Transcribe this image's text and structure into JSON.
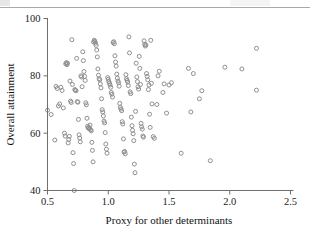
{
  "figure": {
    "header_rule": "page-header-rule",
    "background": "#ffffff",
    "point_color": "#8f8f8f",
    "axis_color": "#6f6f6f"
  },
  "chart_data": {
    "type": "scatter",
    "title": "",
    "xlabel": "Proxy for other determinants",
    "ylabel": "Overall attainment",
    "xlim": [
      0.5,
      2.5
    ],
    "ylim": [
      40,
      100
    ],
    "xticks": [
      0.5,
      1.0,
      1.5,
      2.0,
      2.5
    ],
    "xticklabels": [
      "0.5",
      "1.0",
      "1.5",
      "2.0",
      "2.5"
    ],
    "yticks": [
      40,
      60,
      80,
      100
    ],
    "yticklabels": [
      "40",
      "60",
      "80",
      "100"
    ],
    "grid": false,
    "legend": null,
    "marker": "open-circle",
    "marker_size": 4,
    "n_points": 171,
    "points": [
      [
        0.5,
        68.0
      ],
      [
        0.53,
        66.5
      ],
      [
        0.56,
        57.6
      ],
      [
        0.57,
        76.3
      ],
      [
        0.58,
        75.6
      ],
      [
        0.59,
        69.5
      ],
      [
        0.6,
        70.2
      ],
      [
        0.61,
        76.0
      ],
      [
        0.62,
        74.9
      ],
      [
        0.63,
        68.8
      ],
      [
        0.64,
        60.0
      ],
      [
        0.645,
        59.0
      ],
      [
        0.65,
        84.2
      ],
      [
        0.655,
        84.6
      ],
      [
        0.66,
        83.9
      ],
      [
        0.665,
        84.4
      ],
      [
        0.67,
        56.6
      ],
      [
        0.675,
        57.8
      ],
      [
        0.68,
        58.9
      ],
      [
        0.685,
        78.2
      ],
      [
        0.69,
        71.2
      ],
      [
        0.695,
        70.7
      ],
      [
        0.7,
        92.6
      ],
      [
        0.705,
        77.0
      ],
      [
        0.71,
        53.2
      ],
      [
        0.715,
        49.4
      ],
      [
        0.72,
        40.0
      ],
      [
        0.725,
        75.2
      ],
      [
        0.73,
        75.0
      ],
      [
        0.735,
        74.8
      ],
      [
        0.74,
        86.1
      ],
      [
        0.745,
        71.0
      ],
      [
        0.75,
        70.8
      ],
      [
        0.755,
        64.8
      ],
      [
        0.76,
        59.4
      ],
      [
        0.765,
        58.3
      ],
      [
        0.77,
        57.0
      ],
      [
        0.775,
        80.0
      ],
      [
        0.78,
        79.6
      ],
      [
        0.785,
        76.2
      ],
      [
        0.79,
        88.4
      ],
      [
        0.795,
        85.3
      ],
      [
        0.8,
        81.5
      ],
      [
        0.805,
        79.8
      ],
      [
        0.81,
        78.4
      ],
      [
        0.815,
        70.6
      ],
      [
        0.82,
        69.9
      ],
      [
        0.825,
        65.2
      ],
      [
        0.83,
        62.4
      ],
      [
        0.835,
        61.8
      ],
      [
        0.84,
        62.0
      ],
      [
        0.845,
        61.5
      ],
      [
        0.85,
        62.8
      ],
      [
        0.855,
        61.2
      ],
      [
        0.86,
        60.8
      ],
      [
        0.865,
        56.8
      ],
      [
        0.87,
        54.0
      ],
      [
        0.875,
        50.0
      ],
      [
        0.88,
        91.8
      ],
      [
        0.885,
        92.4
      ],
      [
        0.89,
        92.0
      ],
      [
        0.895,
        91.4
      ],
      [
        0.9,
        90.6
      ],
      [
        0.905,
        89.0
      ],
      [
        0.91,
        86.6
      ],
      [
        0.915,
        82.4
      ],
      [
        0.92,
        80.2
      ],
      [
        0.925,
        79.0
      ],
      [
        0.93,
        78.6
      ],
      [
        0.935,
        77.2
      ],
      [
        0.94,
        75.8
      ],
      [
        0.945,
        72.0
      ],
      [
        0.95,
        68.2
      ],
      [
        0.955,
        67.4
      ],
      [
        0.96,
        66.0
      ],
      [
        0.965,
        64.2
      ],
      [
        0.97,
        63.6
      ],
      [
        0.975,
        60.2
      ],
      [
        0.98,
        56.2
      ],
      [
        0.985,
        54.4
      ],
      [
        0.99,
        53.0
      ],
      [
        0.995,
        79.4
      ],
      [
        1.0,
        78.8
      ],
      [
        1.005,
        78.0
      ],
      [
        1.01,
        77.4
      ],
      [
        1.015,
        76.8
      ],
      [
        1.02,
        76.0
      ],
      [
        1.025,
        74.2
      ],
      [
        1.03,
        73.6
      ],
      [
        1.035,
        72.6
      ],
      [
        1.04,
        91.6
      ],
      [
        1.045,
        91.9
      ],
      [
        1.05,
        91.2
      ],
      [
        1.055,
        87.0
      ],
      [
        1.06,
        84.8
      ],
      [
        1.065,
        83.4
      ],
      [
        1.07,
        80.6
      ],
      [
        1.075,
        79.2
      ],
      [
        1.08,
        78.2
      ],
      [
        1.085,
        77.6
      ],
      [
        1.09,
        76.4
      ],
      [
        1.095,
        70.4
      ],
      [
        1.1,
        69.0
      ],
      [
        1.105,
        68.4
      ],
      [
        1.11,
        67.8
      ],
      [
        1.115,
        64.0
      ],
      [
        1.12,
        63.2
      ],
      [
        1.125,
        58.0
      ],
      [
        1.13,
        53.4
      ],
      [
        1.135,
        53.6
      ],
      [
        1.14,
        52.8
      ],
      [
        1.145,
        80.4
      ],
      [
        1.15,
        79.0
      ],
      [
        1.155,
        78.4
      ],
      [
        1.16,
        77.8
      ],
      [
        1.165,
        76.6
      ],
      [
        1.17,
        93.6
      ],
      [
        1.175,
        88.0
      ],
      [
        1.18,
        74.4
      ],
      [
        1.185,
        73.8
      ],
      [
        1.19,
        65.6
      ],
      [
        1.195,
        62.6
      ],
      [
        1.2,
        61.0
      ],
      [
        1.205,
        59.8
      ],
      [
        1.21,
        57.4
      ],
      [
        1.215,
        49.2
      ],
      [
        1.22,
        46.2
      ],
      [
        1.225,
        67.6
      ],
      [
        1.23,
        84.4
      ],
      [
        1.235,
        79.6
      ],
      [
        1.24,
        78.0
      ],
      [
        1.245,
        76.2
      ],
      [
        1.25,
        75.4
      ],
      [
        1.255,
        86.8
      ],
      [
        1.26,
        82.6
      ],
      [
        1.265,
        77.0
      ],
      [
        1.27,
        63.4
      ],
      [
        1.275,
        62.2
      ],
      [
        1.28,
        61.4
      ],
      [
        1.285,
        59.0
      ],
      [
        1.29,
        58.6
      ],
      [
        1.295,
        92.2
      ],
      [
        1.3,
        91.0
      ],
      [
        1.305,
        90.4
      ],
      [
        1.31,
        90.8
      ],
      [
        1.315,
        80.8
      ],
      [
        1.32,
        79.8
      ],
      [
        1.325,
        78.6
      ],
      [
        1.33,
        75.2
      ],
      [
        1.335,
        76.8
      ],
      [
        1.34,
        66.6
      ],
      [
        1.345,
        62.0
      ],
      [
        1.35,
        92.4
      ],
      [
        1.355,
        77.4
      ],
      [
        1.36,
        70.2
      ],
      [
        1.37,
        58.8
      ],
      [
        1.38,
        58.2
      ],
      [
        1.4,
        70.0
      ],
      [
        1.41,
        80.0
      ],
      [
        1.42,
        81.6
      ],
      [
        1.45,
        74.2
      ],
      [
        1.46,
        77.2
      ],
      [
        1.48,
        67.0
      ],
      [
        1.5,
        76.8
      ],
      [
        1.52,
        77.6
      ],
      [
        1.6,
        53.0
      ],
      [
        1.66,
        82.6
      ],
      [
        1.68,
        67.4
      ],
      [
        1.7,
        80.8
      ],
      [
        1.75,
        72.0
      ],
      [
        1.77,
        74.8
      ],
      [
        1.84,
        50.4
      ],
      [
        1.96,
        83.0
      ],
      [
        2.1,
        82.4
      ],
      [
        2.22,
        89.6
      ],
      [
        2.22,
        75.0
      ]
    ]
  }
}
